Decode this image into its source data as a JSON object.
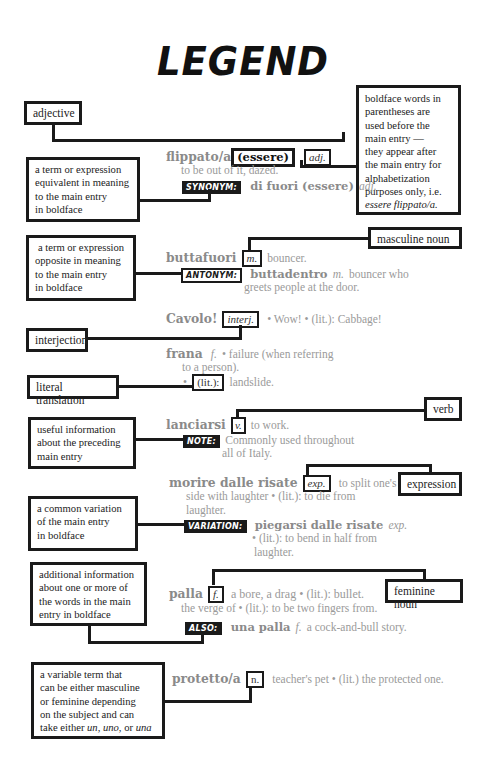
{
  "title": "LEGEND",
  "labels": {
    "adjective": "adjective",
    "boldface_parentheses": [
      "boldface words in",
      "parentheses are",
      "used before the",
      "main entry —",
      "they appear after",
      "the main entry for",
      "alphabetization",
      "purposes only, i.e."
    ],
    "boldface_parentheses_example": "essere flippato/a.",
    "synonym_desc": [
      "a term or expression",
      "equivalent in meaning",
      "to the main entry",
      "in boldface"
    ],
    "masculine_noun": "masculine noun",
    "antonym_desc": [
      "a term or expression",
      "opposite in meaning",
      "to the main entry",
      "in boldface"
    ],
    "interjection": "interjection",
    "literal_translation": "literal translation",
    "verb": "verb",
    "note_desc": [
      "useful information",
      "about the preceding",
      "main entry"
    ],
    "expression": "expression",
    "variation_desc": [
      "a common variation",
      "of the main entry",
      "in boldface"
    ],
    "also_desc": [
      "additional information",
      "about one or more of",
      "the words in the main",
      "entry in boldface"
    ],
    "feminine_noun": "feminine noun",
    "variable_desc": [
      "a variable term that",
      "can be either masculine",
      "or feminine depending",
      "on the subject and can"
    ],
    "variable_desc_last_prefix": "take either ",
    "variable_desc_un": "un",
    "variable_desc_sep1": ", ",
    "variable_desc_uno": "uno",
    "variable_desc_sep2": ", or ",
    "variable_desc_una": "una"
  },
  "entries": {
    "flippato": {
      "headword": "flippato/a",
      "prefix": "(essere)",
      "pos": "adj.",
      "definition": "to be out of it, dazed.",
      "tag": "SYNONYM:",
      "related": "di fuori (essere)",
      "related_pos": "adj."
    },
    "buttafuori": {
      "headword": "buttafuori",
      "pos": "m.",
      "definition": "bouncer.",
      "tag": "ANTONYM:",
      "related": "buttadentro",
      "related_pos": "m.",
      "related_def1": "bouncer who",
      "related_def2": "greets people at the door."
    },
    "cavolo": {
      "headword": "Cavolo!",
      "pos": "interj.",
      "definition": "• Wow! • (lit.): Cabbage!"
    },
    "frana": {
      "headword": "frana",
      "pos": "f.",
      "definition1": "• failure (when referring",
      "definition2": "to a person).",
      "bullet": "•",
      "lit": "(lit.):",
      "lit_def": "landslide."
    },
    "lanciarsi": {
      "headword": "lanciarsi",
      "pos": "v.",
      "definition": "to work.",
      "tag": "NOTE:",
      "note1": "Commonly used throughout",
      "note2": "all of Italy."
    },
    "morire": {
      "headword": "morire dalle risate",
      "pos": "exp.",
      "definition1": "to split one's",
      "definition2": "side with laughter • (lit.): to die from",
      "definition3": "laughter.",
      "tag": "VARIATION:",
      "related": "piegarsi dalle risate",
      "related_pos": "exp.",
      "related_def1": "• (lit.): to bend in half from",
      "related_def2": "laughter."
    },
    "palla": {
      "headword": "palla",
      "pos": "f.",
      "definition1": "a bore, a drag • (lit.): bullet.",
      "definition2": "the verge of • (lit.): to be two fingers from.",
      "tag": "ALSO:",
      "related": "una palla",
      "related_pos": "f.",
      "related_def": "a cock-and-bull story."
    },
    "protetto": {
      "headword": "protetto/a",
      "pos": "n.",
      "definition": "teacher's pet • (lit.) the protected one."
    }
  }
}
